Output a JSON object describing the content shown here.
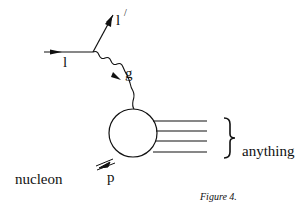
{
  "diagram": {
    "labels": {
      "incoming_lepton": "l",
      "outgoing_lepton": "l",
      "outgoing_prime": "/",
      "gauge_boson": "g",
      "proton": "p",
      "nucleon": "nucleon",
      "products": "anything"
    },
    "caption": "Figure 4.",
    "colors": {
      "ink": "#111111",
      "background": "#ffffff"
    }
  }
}
